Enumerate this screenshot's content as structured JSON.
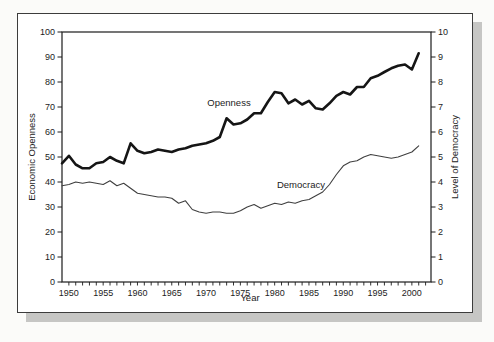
{
  "figure": {
    "background": "#fbfbf9",
    "panel_background": "#ffffff",
    "panel_border_color": "#3c3c3c",
    "shadow_color": "#c6c6c4"
  },
  "chart_data": {
    "type": "line",
    "title": "",
    "xlabel": "Year",
    "ylabel_left": "Economic Openness",
    "ylabel_right": "Level of Democracy",
    "x_range": [
      1949,
      2003
    ],
    "ylim_left": [
      0,
      100
    ],
    "ylim_right": [
      0,
      10
    ],
    "grid": false,
    "legend_position": "inline-annotations",
    "x": [
      1949,
      1950,
      1951,
      1952,
      1953,
      1954,
      1955,
      1956,
      1957,
      1958,
      1959,
      1960,
      1961,
      1962,
      1963,
      1964,
      1965,
      1966,
      1967,
      1968,
      1969,
      1970,
      1971,
      1972,
      1973,
      1974,
      1975,
      1976,
      1977,
      1978,
      1979,
      1980,
      1981,
      1982,
      1983,
      1984,
      1985,
      1986,
      1987,
      1988,
      1989,
      1990,
      1991,
      1992,
      1993,
      1994,
      1995,
      1996,
      1997,
      1998,
      1999,
      2000,
      2001
    ],
    "series": [
      {
        "name": "Openness",
        "axis": "left",
        "color": "#151515",
        "stroke_width": 2.6,
        "values": [
          47.5,
          50.5,
          47,
          45.5,
          45.5,
          47.5,
          48,
          50,
          48.5,
          47.5,
          55.5,
          52.5,
          51.5,
          52,
          53,
          52.5,
          52,
          53,
          53.5,
          54.5,
          55,
          55.5,
          56.5,
          58,
          65.5,
          63,
          63.5,
          65,
          67.5,
          67.5,
          72,
          76,
          75.5,
          71.5,
          73,
          71,
          72.5,
          69.5,
          69,
          71.5,
          74.5,
          76,
          75,
          78,
          78,
          81.5,
          82.5,
          84,
          85.5,
          86.5,
          87,
          85,
          91.5
        ]
      },
      {
        "name": "Democracy",
        "axis": "right",
        "color": "#3f3f3f",
        "stroke_width": 1.1,
        "values": [
          3.85,
          3.9,
          4.0,
          3.95,
          4.0,
          3.95,
          3.9,
          4.05,
          3.85,
          3.95,
          3.75,
          3.55,
          3.5,
          3.45,
          3.4,
          3.4,
          3.35,
          3.15,
          3.25,
          2.9,
          2.8,
          2.75,
          2.8,
          2.8,
          2.75,
          2.75,
          2.85,
          3.0,
          3.1,
          2.95,
          3.05,
          3.15,
          3.1,
          3.2,
          3.15,
          3.25,
          3.3,
          3.45,
          3.6,
          3.9,
          4.3,
          4.65,
          4.8,
          4.85,
          5.0,
          5.1,
          5.05,
          5.0,
          4.95,
          5.0,
          5.1,
          5.2,
          5.45
        ]
      }
    ],
    "axes": {
      "x": {
        "label": "Year",
        "tick_labels": [
          "1950",
          "1955",
          "1960",
          "1965",
          "1970",
          "1975",
          "1980",
          "1985",
          "1990",
          "1995",
          "2000"
        ],
        "labeled_tick_values": [
          1950,
          1955,
          1960,
          1965,
          1970,
          1975,
          1980,
          1985,
          1990,
          1995,
          2000
        ],
        "minor_tick_step": 1,
        "minor_tick_start": 1950,
        "minor_tick_end": 2002
      },
      "left": {
        "label": "Economic Openness",
        "tick_labels": [
          "0",
          "10",
          "20",
          "30",
          "40",
          "50",
          "60",
          "70",
          "80",
          "90",
          "100"
        ],
        "tick_values": [
          0,
          10,
          20,
          30,
          40,
          50,
          60,
          70,
          80,
          90,
          100
        ]
      },
      "right": {
        "label": "Level of Democracy",
        "tick_labels": [
          "0",
          "1",
          "2",
          "3",
          "4",
          "5",
          "6",
          "7",
          "8",
          "9",
          "10"
        ],
        "tick_values": [
          0,
          1,
          2,
          3,
          4,
          5,
          6,
          7,
          8,
          9,
          10
        ]
      }
    },
    "annotations": [
      {
        "text": "Openness",
        "target_series": "Openness"
      },
      {
        "text": "Democracy",
        "target_series": "Democracy"
      }
    ]
  }
}
